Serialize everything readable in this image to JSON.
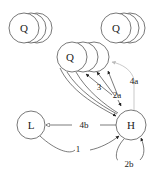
{
  "nodes": {
    "q_left": "Q",
    "q_right": "Q",
    "q_center": "Q",
    "l": "L",
    "h": "H"
  },
  "edges": {
    "e1": "1",
    "e2a": "2a",
    "e2b": "2b",
    "e3": "3",
    "e4a": "4a",
    "e4b": "4b"
  },
  "colors": {
    "stroke": "#333333",
    "faint": "#aaaaaa"
  }
}
